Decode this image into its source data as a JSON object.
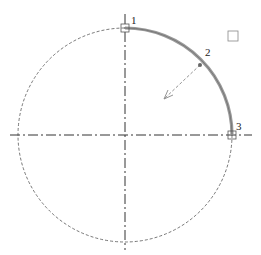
{
  "diagram": {
    "type": "arc-construction",
    "center": {
      "x": 125,
      "y": 135
    },
    "radius": 107,
    "points": [
      {
        "label": "1",
        "x": 125,
        "y": 28
      },
      {
        "label": "2",
        "x": 200,
        "y": 65
      },
      {
        "label": "3",
        "x": 232,
        "y": 135
      }
    ],
    "colors": {
      "arc": "#9a9a9a",
      "circle": "#555555",
      "axis": "#333333",
      "marker": "#555555"
    }
  }
}
